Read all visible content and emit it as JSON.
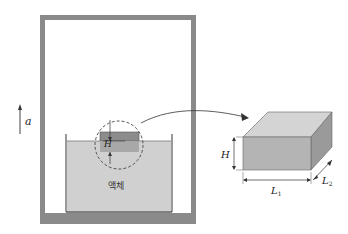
{
  "diagram": {
    "acceleration_label": "a",
    "liquid_label": "액체",
    "submerged_height_label": "H",
    "block": {
      "height_label": "H",
      "length1_label": "L",
      "length1_sub": "1",
      "length2_label": "L",
      "length2_sub": "2"
    },
    "colors": {
      "frame": "#8a8a8a",
      "liquid": "#d0d0d0",
      "block_dark": "#8c8c8c",
      "block_submerged": "#a8a8a8",
      "box_front": "#b4b4b4",
      "box_top": "#d4d4d4",
      "box_side": "#9a9a9a"
    }
  }
}
